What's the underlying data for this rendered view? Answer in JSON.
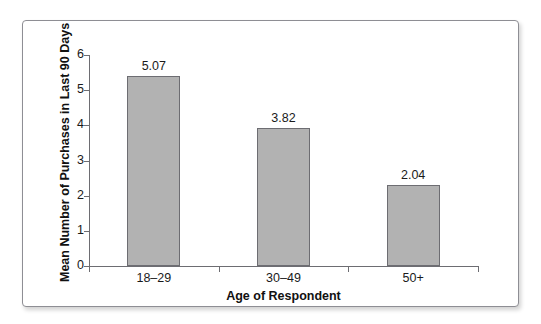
{
  "top_bleed_text": "· · · · · · ·",
  "figure": {
    "background": "#ffffff",
    "frame_color": "#8e8e94",
    "bar_fill": "#b2b2b2",
    "bar_border": "#6d6d72",
    "axis_color": "#6d6d72",
    "text_color": "#1a1a1a"
  },
  "chart_data": {
    "type": "bar",
    "title": "",
    "subtitle": "",
    "xlabel": "Age of Respondent",
    "ylabel": "Mean Number of Purchases in Last 90 Days",
    "categories": [
      "18–29",
      "30–49",
      "50+"
    ],
    "values": [
      5.07,
      3.82,
      2.04
    ],
    "value_labels": [
      "5.07",
      "3.82",
      "2.04"
    ],
    "plotted_heights": [
      5.4,
      3.92,
      2.3
    ],
    "ylim": [
      0,
      6
    ],
    "yticks": [
      0,
      1,
      2,
      3,
      4,
      5,
      6
    ],
    "ytick_labels": [
      "0",
      "1",
      "2",
      "3",
      "4",
      "5",
      "6"
    ],
    "grid": false,
    "legend": null,
    "legend_position": "none",
    "annotations": []
  }
}
